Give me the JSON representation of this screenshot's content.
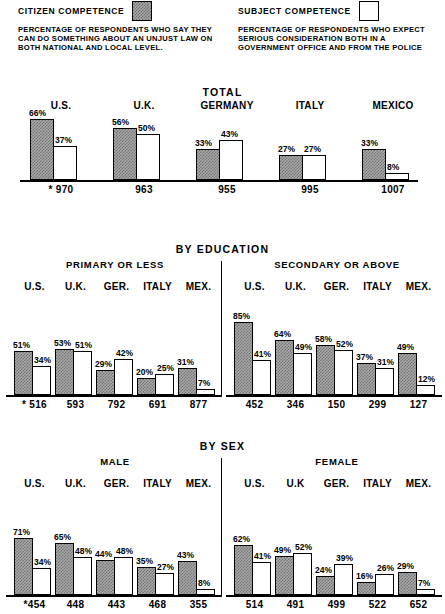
{
  "legend": {
    "citizen": {
      "title": "CITIZEN COMPETENCE",
      "swatch": "filled-square-swatch",
      "description": "PERCENTAGE OF RESPONDENTS WHO SAY THEY CAN DO SOMETHING ABOUT AN UNJUST LAW ON BOTH NATIONAL AND LOCAL LEVEL."
    },
    "subject": {
      "title": "SUBJECT COMPETENCE",
      "swatch": "open-square-swatch",
      "description": "PERCENTAGE OF RESPONDENTS WHO EXPECT SERIOUS CONSIDERATION BOTH IN A GOVERNMENT OFFICE AND FROM THE POLICE"
    }
  },
  "colors": {
    "citizen_fill": "#a9a9a9",
    "subject_fill": "#ffffff",
    "outline": "#000000",
    "background": "#ffffff"
  },
  "sections": [
    {
      "id": "total",
      "title": "TOTAL",
      "panels": [
        {
          "id": "total-panel",
          "title": "",
          "categories": [
            "U.S.",
            "U.K.",
            "GERMANY",
            "ITALY",
            "MEXICO"
          ],
          "citizen": [
            66,
            56,
            33,
            27,
            33
          ],
          "subject": [
            37,
            50,
            43,
            27,
            8
          ],
          "citizen_labels": [
            "66%",
            "56%",
            "33%",
            "27%",
            "33%"
          ],
          "subject_labels": [
            "37%",
            "50%",
            "43%",
            "27%",
            "8%"
          ],
          "n_labels": [
            "* 970",
            "963",
            "955",
            "995",
            "1007"
          ]
        }
      ]
    },
    {
      "id": "by-education",
      "title": "BY EDUCATION",
      "panels": [
        {
          "id": "primary-or-less",
          "title": "PRIMARY OR LESS",
          "categories": [
            "U.S.",
            "U.K.",
            "GER.",
            "ITALY",
            "MEX."
          ],
          "citizen": [
            51,
            53,
            29,
            20,
            31
          ],
          "subject": [
            34,
            51,
            42,
            25,
            7
          ],
          "citizen_labels": [
            "51%",
            "53%",
            "29%",
            "20%",
            "31%"
          ],
          "subject_labels": [
            "34%",
            "51%",
            "42%",
            "25%",
            "7%"
          ],
          "n_labels": [
            "* 516",
            "593",
            "792",
            "691",
            "877"
          ]
        },
        {
          "id": "secondary-or-above",
          "title": "SECONDARY OR ABOVE",
          "categories": [
            "U.S.",
            "U.K.",
            "GER.",
            "ITALY",
            "MEX."
          ],
          "citizen": [
            85,
            64,
            58,
            37,
            49
          ],
          "subject": [
            41,
            49,
            52,
            31,
            12
          ],
          "citizen_labels": [
            "85%",
            "64%",
            "58%",
            "37%",
            "49%"
          ],
          "subject_labels": [
            "41%",
            "49%",
            "52%",
            "31%",
            "12%"
          ],
          "n_labels": [
            "452",
            "346",
            "150",
            "299",
            "127"
          ]
        }
      ]
    },
    {
      "id": "by-sex",
      "title": "BY SEX",
      "panels": [
        {
          "id": "male",
          "title": "MALE",
          "categories": [
            "U.S.",
            "U.K.",
            "GER.",
            "ITALY",
            "MEX."
          ],
          "citizen": [
            71,
            65,
            44,
            35,
            43
          ],
          "subject": [
            34,
            48,
            48,
            27,
            8
          ],
          "citizen_labels": [
            "71%",
            "65%",
            "44%",
            "35%",
            "43%"
          ],
          "subject_labels": [
            "34%",
            "48%",
            "48%",
            "27%",
            "8%"
          ],
          "n_labels": [
            "*454",
            "448",
            "443",
            "468",
            "355"
          ]
        },
        {
          "id": "female",
          "title": "FEMALE",
          "categories": [
            "U.S.",
            "U.K",
            "GER.",
            "ITALY",
            "MEX."
          ],
          "citizen": [
            62,
            49,
            24,
            16,
            29
          ],
          "subject": [
            41,
            52,
            39,
            26,
            7
          ],
          "citizen_labels": [
            "62%",
            "49%",
            "24%",
            "16%",
            "29%"
          ],
          "subject_labels": [
            "41%",
            "52%",
            "39%",
            "26%",
            "7%"
          ],
          "n_labels": [
            "514",
            "491",
            "499",
            "522",
            "652"
          ]
        }
      ]
    }
  ],
  "chart_data": {
    "type": "bar",
    "xlabel": "",
    "ylabel": "Percentage of respondents",
    "ylim": [
      0,
      100
    ],
    "grid": false,
    "legend_position": "top",
    "series_names": [
      "CITIZEN COMPETENCE",
      "SUBJECT COMPETENCE"
    ],
    "panels": [
      {
        "panel": "TOTAL",
        "categories": [
          "U.S.",
          "U.K.",
          "GERMANY",
          "ITALY",
          "MEXICO"
        ],
        "series": [
          {
            "name": "CITIZEN COMPETENCE",
            "values": [
              66,
              56,
              33,
              27,
              33
            ]
          },
          {
            "name": "SUBJECT COMPETENCE",
            "values": [
              37,
              50,
              43,
              27,
              8
            ]
          }
        ],
        "n": [
          970,
          963,
          955,
          995,
          1007
        ]
      },
      {
        "panel": "BY EDUCATION — PRIMARY OR LESS",
        "categories": [
          "U.S.",
          "U.K.",
          "GER.",
          "ITALY",
          "MEX."
        ],
        "series": [
          {
            "name": "CITIZEN COMPETENCE",
            "values": [
              51,
              53,
              29,
              20,
              31
            ]
          },
          {
            "name": "SUBJECT COMPETENCE",
            "values": [
              34,
              51,
              42,
              25,
              7
            ]
          }
        ],
        "n": [
          516,
          593,
          792,
          691,
          877
        ]
      },
      {
        "panel": "BY EDUCATION — SECONDARY OR ABOVE",
        "categories": [
          "U.S.",
          "U.K.",
          "GER.",
          "ITALY",
          "MEX."
        ],
        "series": [
          {
            "name": "CITIZEN COMPETENCE",
            "values": [
              85,
              64,
              58,
              37,
              49
            ]
          },
          {
            "name": "SUBJECT COMPETENCE",
            "values": [
              41,
              49,
              52,
              31,
              12
            ]
          }
        ],
        "n": [
          452,
          346,
          150,
          299,
          127
        ]
      },
      {
        "panel": "BY SEX — MALE",
        "categories": [
          "U.S.",
          "U.K.",
          "GER.",
          "ITALY",
          "MEX."
        ],
        "series": [
          {
            "name": "CITIZEN COMPETENCE",
            "values": [
              71,
              65,
              44,
              35,
              43
            ]
          },
          {
            "name": "SUBJECT COMPETENCE",
            "values": [
              34,
              48,
              48,
              27,
              8
            ]
          }
        ],
        "n": [
          454,
          448,
          443,
          468,
          355
        ]
      },
      {
        "panel": "BY SEX — FEMALE",
        "categories": [
          "U.S.",
          "U.K",
          "GER.",
          "ITALY",
          "MEX."
        ],
        "series": [
          {
            "name": "CITIZEN COMPETENCE",
            "values": [
              62,
              49,
              24,
              16,
              29
            ]
          },
          {
            "name": "SUBJECT COMPETENCE",
            "values": [
              41,
              52,
              39,
              26,
              7
            ]
          }
        ],
        "n": [
          514,
          491,
          499,
          522,
          652
        ]
      }
    ],
    "notes": [
      "* indicates the number of respondents (N) for each national sample"
    ]
  }
}
